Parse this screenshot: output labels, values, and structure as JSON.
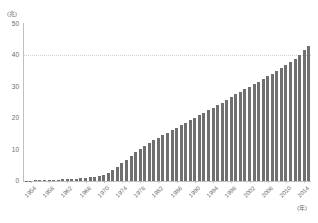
{
  "chart_data": {
    "type": "bar",
    "title": "",
    "subtitle": "",
    "xlabel": "(年)",
    "ylabel": "(兆)",
    "ylim": [
      0,
      50
    ],
    "ytick_values": [
      0,
      10,
      20,
      30,
      40,
      50
    ],
    "ytick_labels": [
      "0",
      "10",
      "20",
      "30",
      "40",
      "50"
    ],
    "gridlines": [
      40
    ],
    "grid": "dotted-horizontal-at-40-only",
    "legend": "none",
    "bar_color": "#707070",
    "axis_color": "#bfbfbf",
    "text_color": "#6b6b6b",
    "xtick_labels": [
      "1954",
      "1958",
      "1962",
      "1966",
      "1970",
      "1974",
      "1978",
      "1982",
      "1986",
      "1990",
      "1994",
      "1998",
      "2002",
      "2006",
      "2010",
      "2014"
    ],
    "xtick_step_years": 4,
    "categories": [
      "1953",
      "1954",
      "1955",
      "1956",
      "1957",
      "1958",
      "1959",
      "1960",
      "1961",
      "1962",
      "1963",
      "1964",
      "1965",
      "1966",
      "1967",
      "1968",
      "1969",
      "1970",
      "1971",
      "1972",
      "1973",
      "1974",
      "1975",
      "1976",
      "1977",
      "1978",
      "1979",
      "1980",
      "1981",
      "1982",
      "1983",
      "1984",
      "1985",
      "1986",
      "1987",
      "1988",
      "1989",
      "1990",
      "1991",
      "1992",
      "1993",
      "1994",
      "1995",
      "1996",
      "1997",
      "1998",
      "1999",
      "2000",
      "2001",
      "2002",
      "2003",
      "2004",
      "2005",
      "2006",
      "2007",
      "2008",
      "2009",
      "2010",
      "2011",
      "2012",
      "2013",
      "2014",
      "2015"
    ],
    "values": [
      0.1,
      0.1,
      0.2,
      0.2,
      0.3,
      0.3,
      0.4,
      0.4,
      0.5,
      0.6,
      0.7,
      0.8,
      0.9,
      1.0,
      1.2,
      1.4,
      1.7,
      2.0,
      2.6,
      3.4,
      4.5,
      5.6,
      6.8,
      8.0,
      9.1,
      10.2,
      11.2,
      12.1,
      13.0,
      13.8,
      14.6,
      15.4,
      16.2,
      17.0,
      17.8,
      18.6,
      19.4,
      20.2,
      21.0,
      21.8,
      22.6,
      23.4,
      24.2,
      25.0,
      25.9,
      26.8,
      27.6,
      28.4,
      29.2,
      30.0,
      30.8,
      31.6,
      32.4,
      33.3,
      34.2,
      35.1,
      36.0,
      36.9,
      37.9,
      38.9,
      40.2,
      41.6,
      43.0
    ]
  }
}
